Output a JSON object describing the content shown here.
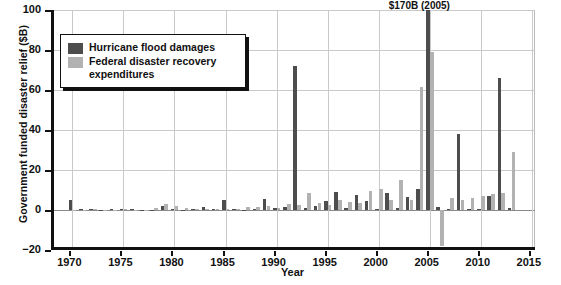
{
  "chart_data": {
    "type": "bar",
    "title": "",
    "xlabel": "Year",
    "ylabel": "Government funded disaster relief ($B)",
    "xlim": [
      1968.2,
      2015.6
    ],
    "ylim": [
      -20,
      100
    ],
    "ytick_labels": [
      "100",
      "80",
      "60",
      "40",
      "20",
      "0",
      "−20"
    ],
    "ytick_values": [
      100,
      80,
      60,
      40,
      20,
      0,
      -20
    ],
    "xtick_labels": [
      "1970",
      "1975",
      "1980",
      "1985",
      "1990",
      "1995",
      "2000",
      "2005",
      "2010",
      "2015"
    ],
    "xtick_values": [
      1970,
      1975,
      1980,
      1985,
      1990,
      1995,
      2000,
      2005,
      2010,
      2015
    ],
    "grid": true,
    "legend_position": "upper-left",
    "annotations": [
      {
        "text": "$170B (2005)",
        "x": 2005,
        "y": 100
      }
    ],
    "series": [
      {
        "name": "Hurricane flood damages",
        "color": "#4d4d4d",
        "x": [
          1970,
          1971,
          1972,
          1973,
          1974,
          1975,
          1976,
          1977,
          1978,
          1979,
          1980,
          1981,
          1982,
          1983,
          1984,
          1985,
          1986,
          1987,
          1988,
          1989,
          1990,
          1991,
          1992,
          1993,
          1994,
          1995,
          1996,
          1997,
          1998,
          1999,
          2000,
          2001,
          2002,
          2003,
          2004,
          2005,
          2006,
          2007,
          2008,
          2009,
          2010,
          2011,
          2012,
          2013
        ],
        "values": [
          5.2,
          0.4,
          0.6,
          0.2,
          0.3,
          0.4,
          0.3,
          0.2,
          0.2,
          1.8,
          0.6,
          0.2,
          0.3,
          1.3,
          0.4,
          5.0,
          0.3,
          0.2,
          0.4,
          5.5,
          1.0,
          1.6,
          72.0,
          1.0,
          2.0,
          4.5,
          9.0,
          1.0,
          7.5,
          4.5,
          0.5,
          8.5,
          1.0,
          6.5,
          10.5,
          100.0,
          1.3,
          0.6,
          38.0,
          0.4,
          0.6,
          7.0,
          66.0,
          1.0
        ]
      },
      {
        "name": "Federal disaster recovery expenditures",
        "color": "#b2b2b2",
        "x": [
          1970,
          1971,
          1972,
          1973,
          1974,
          1975,
          1976,
          1977,
          1978,
          1979,
          1980,
          1981,
          1982,
          1983,
          1984,
          1985,
          1986,
          1987,
          1988,
          1989,
          1990,
          1991,
          1992,
          1993,
          1994,
          1995,
          1996,
          1997,
          1998,
          1999,
          2000,
          2001,
          2002,
          2003,
          2004,
          2005,
          2006,
          2007,
          2008,
          2009,
          2010,
          2011,
          2012,
          2013
        ],
        "values": [
          0.2,
          0.2,
          0.3,
          0.2,
          0.2,
          0.3,
          0.2,
          0.2,
          0.8,
          2.8,
          2.0,
          0.8,
          0.4,
          0.3,
          0.3,
          0.6,
          0.5,
          1.5,
          1.5,
          2.0,
          1.0,
          3.0,
          2.5,
          8.5,
          3.5,
          2.5,
          5.0,
          4.0,
          3.5,
          9.5,
          10.5,
          5.0,
          15.0,
          5.0,
          61.5,
          79.0,
          -18.0,
          6.0,
          5.0,
          6.0,
          7.0,
          8.0,
          8.5,
          29.0
        ]
      }
    ]
  },
  "legend": {
    "items": [
      {
        "label": "Hurricane flood damages"
      },
      {
        "label": "Federal disaster recovery expenditures"
      }
    ]
  }
}
